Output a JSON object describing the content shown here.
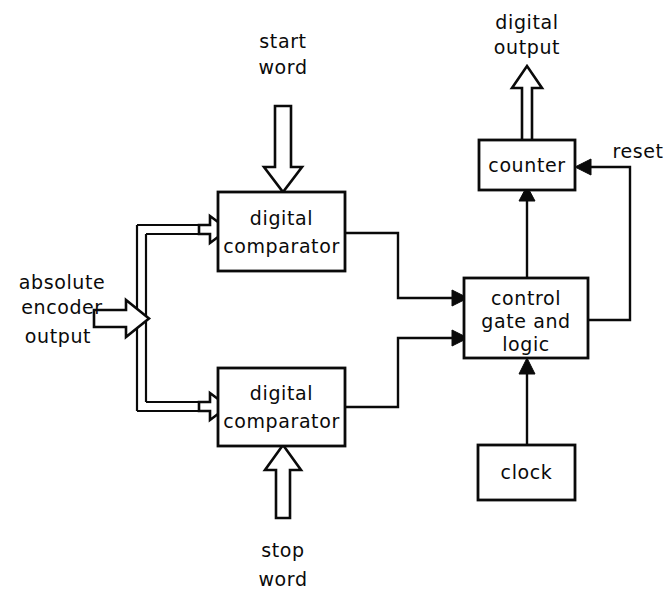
{
  "diagram": {
    "background_color": "#ffffff",
    "line_color": "#0a0a0a",
    "blocks": [
      {
        "id": "comparator_top",
        "label_line1": "digital",
        "label_line2": "comparator"
      },
      {
        "id": "comparator_bottom",
        "label_line1": "digital",
        "label_line2": "comparator"
      },
      {
        "id": "control",
        "label_line1": "control",
        "label_line2": "gate and",
        "label_line3": "logic"
      },
      {
        "id": "counter",
        "label_line1": "counter"
      },
      {
        "id": "clock",
        "label_line1": "clock"
      }
    ],
    "signals": [
      {
        "id": "start_word",
        "line1": "start",
        "line2": "word",
        "kind": "block-arrow-down"
      },
      {
        "id": "stop_word",
        "line1": "stop",
        "line2": "word",
        "kind": "block-arrow-up"
      },
      {
        "id": "encoder_input",
        "line1": "absolute",
        "line2": "encoder",
        "line3": "output",
        "kind": "block-arrow-right"
      },
      {
        "id": "digital_output",
        "line1": "digital",
        "line2": "output",
        "kind": "block-arrow-up"
      },
      {
        "id": "reset",
        "line1": "reset",
        "kind": "feedback-line"
      }
    ]
  }
}
